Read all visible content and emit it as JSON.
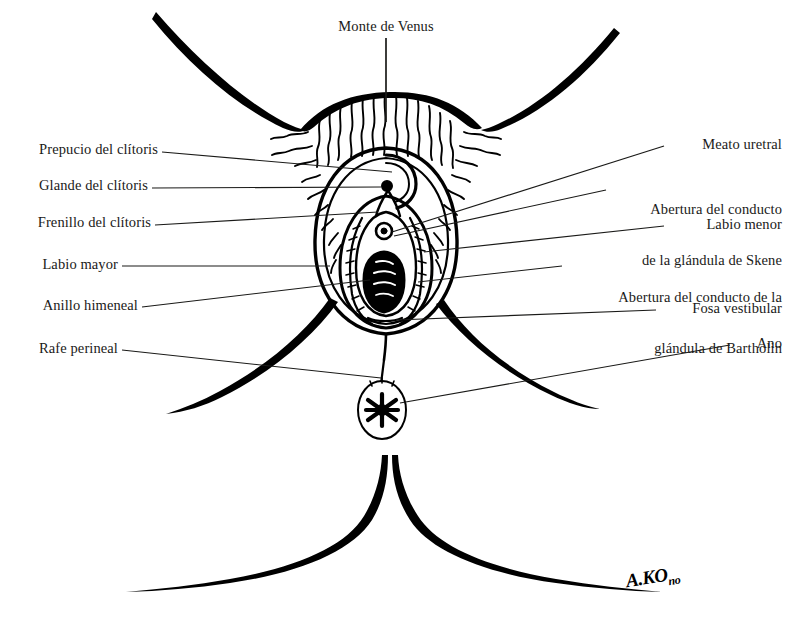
{
  "figure": {
    "title_label": "Monte de Venus",
    "background_color": "#ffffff",
    "ink_color": "#000000",
    "leader_color": "#1a1a18",
    "signature": "A.KO",
    "signature_suffix": "no"
  },
  "labels_left": [
    {
      "text": "Prepucio del clítoris",
      "name": "label-prepucio-del-clitoris"
    },
    {
      "text": "Glande del clítoris",
      "name": "label-glande-del-clitoris"
    },
    {
      "text": "Frenillo del clítoris",
      "name": "label-frenillo-del-clitoris"
    },
    {
      "text": "Labio mayor",
      "name": "label-labio-mayor"
    },
    {
      "text": "Anillo himeneal",
      "name": "label-anillo-himeneal"
    },
    {
      "text": "Rafe perineal",
      "name": "label-rafe-perineal"
    }
  ],
  "labels_right": [
    {
      "line1": "Meato uretral",
      "line2": "",
      "name": "label-meato-uretral"
    },
    {
      "line1": "Abertura del conducto",
      "line2": "de la glándula de Skene",
      "name": "label-abertura-conducto-skene"
    },
    {
      "line1": "Labio menor",
      "line2": "",
      "name": "label-labio-menor"
    },
    {
      "line1": "Abertura del conducto de la",
      "line2": "glándula de Bartholin",
      "name": "label-abertura-conducto-bartholin"
    },
    {
      "line1": "Fosa vestibular",
      "line2": "",
      "name": "label-fosa-vestibular"
    },
    {
      "line1": "Ano",
      "line2": "",
      "name": "label-ano"
    }
  ]
}
